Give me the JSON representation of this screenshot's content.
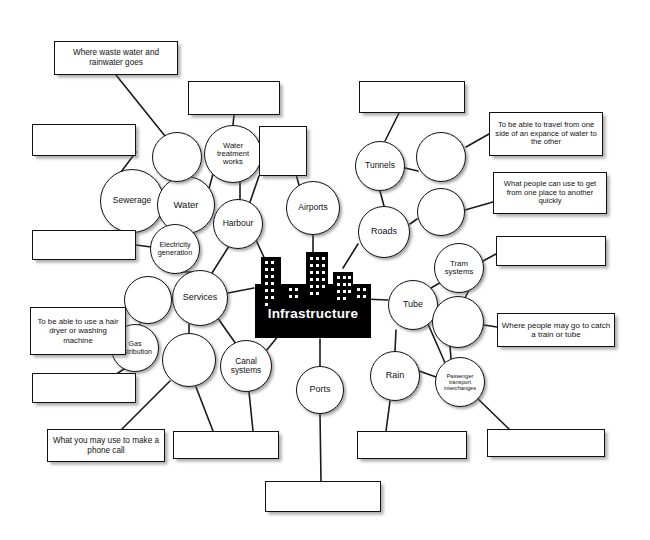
{
  "document": {
    "title": "Infrastructure mind map worksheet",
    "center_label": "Infrastructure",
    "center_icon": "city-skyline-icon",
    "background_color": "#ffffff",
    "ink_color": "#111111",
    "center_fill_color": "#000000",
    "center_text_color": "#ffffff"
  },
  "nodes": [
    {
      "id": "sewerage",
      "label": "Sewerage",
      "cx": 132,
      "cy": 201,
      "r": 32,
      "font": 8.5,
      "empty": false
    },
    {
      "id": "water",
      "label": "Water",
      "cx": 186,
      "cy": 205,
      "r": 29,
      "font": 9.5,
      "empty": false
    },
    {
      "id": "water-treatment",
      "label": "Water treatment works",
      "cx": 233,
      "cy": 154,
      "r": 29,
      "font": 7.6,
      "empty": false
    },
    {
      "id": "harbour",
      "label": "Harbour",
      "cx": 238,
      "cy": 224,
      "r": 25,
      "font": 8.5,
      "empty": false
    },
    {
      "id": "airports",
      "label": "Airports",
      "cx": 313,
      "cy": 208,
      "r": 27,
      "font": 8.5,
      "empty": false
    },
    {
      "id": "tunnels",
      "label": "Tunnels",
      "cx": 380,
      "cy": 166,
      "r": 25,
      "font": 8.5,
      "empty": false
    },
    {
      "id": "roads",
      "label": "Roads",
      "cx": 384,
      "cy": 232,
      "r": 26,
      "font": 9,
      "empty": false
    },
    {
      "id": "electricity",
      "label": "Electricity generation",
      "cx": 175,
      "cy": 249,
      "r": 25,
      "font": 7.3,
      "empty": false
    },
    {
      "id": "services",
      "label": "Services",
      "cx": 200,
      "cy": 298,
      "r": 28,
      "font": 9,
      "empty": false
    },
    {
      "id": "gas",
      "label": "Gas distribution",
      "cx": 135,
      "cy": 348,
      "r": 24,
      "font": 7.0,
      "empty": false
    },
    {
      "id": "canal",
      "label": "Canal systems",
      "cx": 246,
      "cy": 366,
      "r": 26,
      "font": 8.3,
      "empty": false
    },
    {
      "id": "ports",
      "label": "Ports",
      "cx": 320,
      "cy": 390,
      "r": 24,
      "font": 9,
      "empty": false
    },
    {
      "id": "tram",
      "label": "Tram systems",
      "cx": 459,
      "cy": 268,
      "r": 25,
      "font": 7.8,
      "empty": false
    },
    {
      "id": "tube",
      "label": "Tube",
      "cx": 413,
      "cy": 305,
      "r": 25,
      "font": 9,
      "empty": false
    },
    {
      "id": "rail",
      "label": "Rain",
      "cx": 395,
      "cy": 376,
      "r": 25,
      "font": 9,
      "empty": false
    },
    {
      "id": "interchanges",
      "label": "Passenger transport interchanges",
      "cx": 460,
      "cy": 382,
      "r": 25,
      "font": 5.6,
      "empty": false
    },
    {
      "id": "blank-water-top",
      "label": "",
      "cx": 177,
      "cy": 157,
      "r": 25,
      "font": 8,
      "empty": true
    },
    {
      "id": "blank-services-nw",
      "label": "",
      "cx": 148,
      "cy": 300,
      "r": 24,
      "font": 8,
      "empty": true
    },
    {
      "id": "blank-services-s",
      "label": "",
      "cx": 189,
      "cy": 360,
      "r": 27,
      "font": 8,
      "empty": true
    },
    {
      "id": "blank-harbour-e",
      "label": "",
      "cx": 441,
      "cy": 157,
      "r": 25,
      "font": 8,
      "empty": true
    },
    {
      "id": "blank-roads-e",
      "label": "",
      "cx": 441,
      "cy": 212,
      "r": 24,
      "font": 8,
      "empty": true
    },
    {
      "id": "blank-tube-e",
      "label": "",
      "cx": 458,
      "cy": 322,
      "r": 26,
      "font": 8,
      "empty": true
    }
  ],
  "boxes": [
    {
      "id": "waste-water",
      "text": "Where waste water and rainwater goes",
      "x": 54,
      "y": 41,
      "w": 124,
      "h": 34,
      "font": 8.2,
      "empty": false
    },
    {
      "id": "box-top-left-blank",
      "text": "",
      "x": 32,
      "y": 124,
      "w": 104,
      "h": 32,
      "font": 8,
      "empty": true
    },
    {
      "id": "box-water-top-blank",
      "text": "",
      "x": 188,
      "y": 81,
      "w": 92,
      "h": 34,
      "font": 8,
      "empty": true
    },
    {
      "id": "box-harbour-blank",
      "text": "",
      "x": 259,
      "y": 126,
      "w": 48,
      "h": 50,
      "font": 8,
      "empty": true
    },
    {
      "id": "box-tunnels-blank",
      "text": "",
      "x": 359,
      "y": 81,
      "w": 106,
      "h": 32,
      "font": 8,
      "empty": true
    },
    {
      "id": "expance",
      "text": "To be able to travel from one side of an expance of water to the other",
      "x": 489,
      "y": 112,
      "w": 114,
      "h": 44,
      "font": 7.6,
      "empty": false
    },
    {
      "id": "quickly",
      "text": "What people can use to get from one place to another quickly",
      "x": 493,
      "y": 172,
      "w": 114,
      "h": 42,
      "font": 7.6,
      "empty": false
    },
    {
      "id": "box-left-mid-blank",
      "text": "",
      "x": 32,
      "y": 230,
      "w": 104,
      "h": 30,
      "font": 8,
      "empty": true
    },
    {
      "id": "hair-dryer",
      "text": "To be able to use a hair dryer or washing machine",
      "x": 30,
      "y": 307,
      "w": 96,
      "h": 48,
      "font": 7.8,
      "empty": false
    },
    {
      "id": "box-gas-blank",
      "text": "",
      "x": 32,
      "y": 373,
      "w": 104,
      "h": 30,
      "font": 8,
      "empty": true
    },
    {
      "id": "phone-call",
      "text": "What you may use to make a phone call",
      "x": 47,
      "y": 429,
      "w": 118,
      "h": 33,
      "font": 8.2,
      "empty": false
    },
    {
      "id": "box-tram-blank",
      "text": "",
      "x": 496,
      "y": 236,
      "w": 110,
      "h": 30,
      "font": 8,
      "empty": true
    },
    {
      "id": "catch-train",
      "text": "Where people may go to catch a train or tube",
      "x": 497,
      "y": 313,
      "w": 118,
      "h": 34,
      "font": 8.0,
      "empty": false
    },
    {
      "id": "box-bottom-1-blank",
      "text": "",
      "x": 173,
      "y": 431,
      "w": 106,
      "h": 28,
      "font": 8,
      "empty": true
    },
    {
      "id": "box-bottom-2-blank",
      "text": "",
      "x": 357,
      "y": 431,
      "w": 110,
      "h": 28,
      "font": 8,
      "empty": true
    },
    {
      "id": "box-bottom-3-blank",
      "text": "",
      "x": 487,
      "y": 429,
      "w": 118,
      "h": 28,
      "font": 8,
      "empty": true
    },
    {
      "id": "box-bottom-4-blank",
      "text": "",
      "x": 265,
      "y": 481,
      "w": 116,
      "h": 31,
      "font": 8,
      "empty": true
    }
  ],
  "edges": [
    [
      "waste-water-box",
      "blank-water-top"
    ],
    [
      "box-top-left-blank",
      "sewerage"
    ],
    [
      "sewerage",
      "water"
    ],
    [
      "blank-water-top",
      "water"
    ],
    [
      "water",
      "water-treatment"
    ],
    [
      "box-water-top-blank",
      "water-treatment"
    ],
    [
      "water-treatment",
      "harbour"
    ],
    [
      "box-harbour-blank",
      "harbour"
    ],
    [
      "water",
      "electricity"
    ],
    [
      "box-left-mid-blank",
      "electricity"
    ],
    [
      "electricity",
      "services"
    ],
    [
      "harbour",
      "services"
    ],
    [
      "harbour",
      "center"
    ],
    [
      "airports",
      "center"
    ],
    [
      "box-harbour-blank",
      "airports"
    ],
    [
      "box-tunnels-blank",
      "tunnels"
    ],
    [
      "tunnels",
      "roads"
    ],
    [
      "blank-harbour-e",
      "tunnels"
    ],
    [
      "blank-harbour-e",
      "expance"
    ],
    [
      "blank-roads-e",
      "quickly"
    ],
    [
      "blank-roads-e",
      "roads"
    ],
    [
      "roads",
      "center"
    ],
    [
      "services",
      "center"
    ],
    [
      "services",
      "blank-services-nw"
    ],
    [
      "services",
      "blank-services-s"
    ],
    [
      "blank-services-nw",
      "gas"
    ],
    [
      "gas",
      "hair-dryer"
    ],
    [
      "gas",
      "box-gas-blank"
    ],
    [
      "blank-services-s",
      "phone-call"
    ],
    [
      "blank-services-s",
      "box-bottom-1-blank"
    ],
    [
      "services",
      "canal"
    ],
    [
      "canal",
      "center"
    ],
    [
      "canal",
      "box-bottom-1-blank"
    ],
    [
      "center",
      "ports"
    ],
    [
      "ports",
      "box-bottom-4-blank"
    ],
    [
      "center",
      "tube"
    ],
    [
      "tube",
      "tram"
    ],
    [
      "tram",
      "box-tram-blank"
    ],
    [
      "tube",
      "blank-tube-e"
    ],
    [
      "tram",
      "blank-tube-e"
    ],
    [
      "blank-tube-e",
      "catch-train"
    ],
    [
      "tube",
      "rail"
    ],
    [
      "tube",
      "interchanges"
    ],
    [
      "rail",
      "interchanges"
    ],
    [
      "blank-tube-e",
      "interchanges"
    ],
    [
      "rail",
      "box-bottom-2-blank"
    ],
    [
      "interchanges",
      "box-bottom-3-blank"
    ]
  ]
}
